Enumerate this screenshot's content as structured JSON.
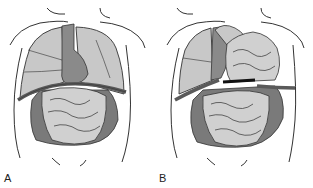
{
  "panels": [
    {
      "id": "A",
      "label": "A",
      "description": "Normal thoracoabdominal anatomy: lungs and heart above intact diaphragm, intestines below"
    },
    {
      "id": "B",
      "label": "B",
      "description": "Diaphragmatic hernia: intestines herniated into left thoracic cavity, heart shifted"
    }
  ],
  "colors": {
    "outline": "#333333",
    "lung": "#c8c8c8",
    "heart": "#8a8a8a",
    "diaphragm": "#5a5a5a",
    "intestine_small": "#d0d0d0",
    "intestine_large": "#7a7a7a",
    "background": "#ffffff"
  }
}
